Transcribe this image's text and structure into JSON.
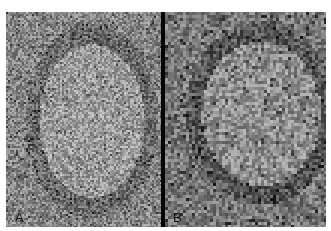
{
  "figure": {
    "panels": [
      {
        "id": "A",
        "label": "A",
        "description": "Low-magnification grayscale micrograph of lymphoid tissue showing a pale oval follicle",
        "base_gray": "#8a8a8a",
        "follicle_gray": "#9e9e9e",
        "rim_gray": "#6a6a6a",
        "grain": 2
      },
      {
        "id": "B",
        "label": "B",
        "description": "Higher-magnification grayscale micrograph of densely packed cells with a paler central region",
        "base_gray": "#7a7a7a",
        "follicle_gray": "#909090",
        "rim_gray": "#555555",
        "grain": 3
      }
    ],
    "divider_color": "#050505"
  }
}
